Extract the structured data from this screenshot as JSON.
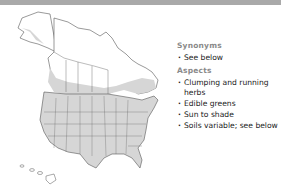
{
  "header_bar": {
    "color": "#a9a9a9"
  },
  "map": {
    "region": "North America (Canada, United States, Alaska, Hawaii)",
    "fill_color": "#d6d6d6",
    "outline_color": "#555555",
    "background_color": "#ffffff"
  },
  "info": {
    "synonyms": {
      "heading": "Synonyms",
      "items": [
        "See below"
      ]
    },
    "aspects": {
      "heading": "Aspects",
      "items": [
        "Clumping and running herbs",
        "Edible greens",
        "Sun to shade",
        "Soils variable; see below"
      ]
    }
  }
}
